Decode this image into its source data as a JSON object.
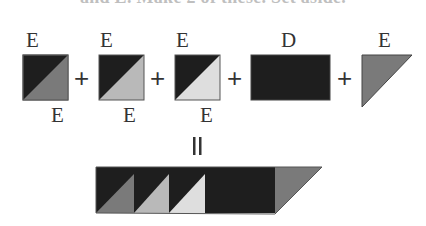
{
  "caption": {
    "text": "and E. Make 2 of these. Set aside."
  },
  "colors": {
    "dark": "#1e1e1e",
    "medium": "#7a7a7a",
    "light": "#b9b9b9",
    "lightest": "#dedede",
    "outline": "#555555"
  },
  "pieces": [
    {
      "name": "hst-1",
      "top_label": "E",
      "bottom_label": "E",
      "shape": "half-square-triangle",
      "colors": [
        "dark",
        "medium"
      ]
    },
    {
      "name": "hst-2",
      "top_label": "E",
      "bottom_label": "E",
      "shape": "half-square-triangle",
      "colors": [
        "dark",
        "light"
      ]
    },
    {
      "name": "hst-3",
      "top_label": "E",
      "bottom_label": "E",
      "shape": "half-square-triangle",
      "colors": [
        "dark",
        "lightest"
      ]
    },
    {
      "name": "rect-d",
      "top_label": "D",
      "shape": "rectangle",
      "colors": [
        "dark"
      ]
    },
    {
      "name": "triangle-e",
      "top_label": "E",
      "shape": "triangle",
      "colors": [
        "medium"
      ]
    }
  ],
  "operators": {
    "plus": "+",
    "equals": "||"
  },
  "result": {
    "name": "assembled-strip",
    "shape": "strip"
  }
}
